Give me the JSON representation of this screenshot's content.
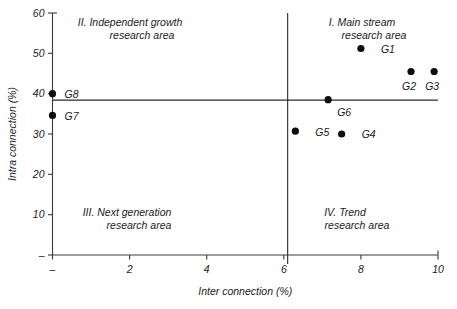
{
  "chart_data": {
    "type": "scatter",
    "title": "",
    "xlabel": "Inter connection (%)",
    "ylabel": "Intra connection (%)",
    "xlim": [
      0,
      10
    ],
    "ylim": [
      0,
      60
    ],
    "grid": false,
    "legend": "none",
    "xticks": [
      {
        "value": 0,
        "label": "–"
      },
      {
        "value": 2,
        "label": "2"
      },
      {
        "value": 4,
        "label": "4"
      },
      {
        "value": 6,
        "label": "6"
      },
      {
        "value": 8,
        "label": "8"
      },
      {
        "value": 10,
        "label": "10"
      }
    ],
    "yticks": [
      {
        "value": 0,
        "label": "–"
      },
      {
        "value": 10,
        "label": "10"
      },
      {
        "value": 20,
        "label": "20"
      },
      {
        "value": 30,
        "label": "30"
      },
      {
        "value": 40,
        "label": "40"
      },
      {
        "value": 50,
        "label": "50"
      },
      {
        "value": 60,
        "label": "60"
      }
    ],
    "dividers": {
      "vertical_x": 6.1,
      "horizontal_y": 38.4
    },
    "points": [
      {
        "label": "G1",
        "x": 8.0,
        "y": 51.2,
        "label_dx": 20,
        "label_dy": 5
      },
      {
        "label": "G2",
        "x": 9.3,
        "y": 45.5,
        "label_dx": -9,
        "label_dy": 19
      },
      {
        "label": "G3",
        "x": 9.9,
        "y": 45.5,
        "label_dx": -9,
        "label_dy": 19
      },
      {
        "label": "G4",
        "x": 7.5,
        "y": 30.0,
        "label_dx": 20,
        "label_dy": 4
      },
      {
        "label": "G5",
        "x": 6.3,
        "y": 30.7,
        "label_dx": 20,
        "label_dy": 5
      },
      {
        "label": "G6",
        "x": 7.15,
        "y": 38.5,
        "label_dx": 9,
        "label_dy": 16
      },
      {
        "label": "G7",
        "x": 0.0,
        "y": 34.6,
        "label_dx": 12,
        "label_dy": 5
      },
      {
        "label": "G8",
        "x": 0.0,
        "y": 40.0,
        "label_dx": 12,
        "label_dy": 4
      }
    ],
    "quadrants": [
      {
        "id": "I",
        "name": "main-stream",
        "line1": "I. Main stream",
        "line2": "research area",
        "anchor_x": 362,
        "anchor_y": 26,
        "align": "middle"
      },
      {
        "id": "II",
        "name": "independent-growth",
        "line1": "II. Independent growth",
        "line2": "research area",
        "anchor_x": 130,
        "anchor_y": 26,
        "align": "middle"
      },
      {
        "id": "III",
        "name": "next-generation",
        "line1": "III. Next generation",
        "line2": "research area",
        "anchor_x": 127,
        "anchor_y": 216,
        "align": "middle"
      },
      {
        "id": "IV",
        "name": "trend",
        "line1": "IV. Trend",
        "line2": "research area",
        "anchor_x": 345,
        "anchor_y": 216,
        "align": "middle"
      }
    ],
    "colors": {
      "point": "#0d0d0d",
      "axis": "#3a3a3a",
      "divider": "#2a2a2a",
      "text": "#1a1a1a",
      "background": "#ffffff"
    }
  }
}
